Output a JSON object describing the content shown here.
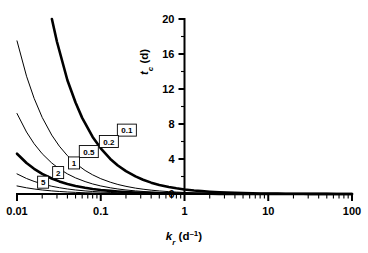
{
  "chart_data": {
    "type": "line",
    "title": "",
    "xlabel": "k_r (d^-1)",
    "ylabel": "t_c (d)",
    "xscale": "log",
    "yscale": "linear",
    "xlim": [
      0.01,
      100
    ],
    "ylim": [
      0,
      20
    ],
    "xtick_labels": [
      "0.01",
      "0.1",
      "1",
      "10",
      "100"
    ],
    "xtick_values": [
      0.01,
      0.1,
      1,
      10,
      100
    ],
    "ytick_labels": [
      "0",
      "4",
      "8",
      "12",
      "16",
      "20"
    ],
    "ytick_values": [
      0,
      4,
      8,
      12,
      16,
      20
    ],
    "yminor_values": [
      2,
      6,
      10,
      14,
      18
    ],
    "grid": false,
    "legend": "inline-labels",
    "y_axis_position": 1.0,
    "series": [
      {
        "name": "0.1",
        "label": "0.1",
        "linewidth": "thick",
        "color": "#000000",
        "x": [
          0.0261,
          0.03,
          0.04,
          0.05,
          0.06,
          0.08,
          0.1,
          0.13,
          0.16,
          0.2,
          0.26,
          0.32,
          0.4,
          0.5,
          0.65,
          0.8,
          1.0,
          1.3,
          1.6,
          2.0,
          2.6,
          3.2,
          4.0,
          5.0,
          6.5,
          8.0,
          10.0,
          13.0,
          16.0,
          20.0,
          26.0,
          32.0,
          40.0,
          50.0,
          65.0,
          80.0,
          100.0
        ],
        "y": [
          20.0,
          17.4,
          13.0,
          10.45,
          8.7,
          6.52,
          5.22,
          4.01,
          3.26,
          2.61,
          2.01,
          1.63,
          1.3,
          1.04,
          0.8,
          0.65,
          0.52,
          0.4,
          0.33,
          0.26,
          0.2,
          0.16,
          0.13,
          0.1,
          0.08,
          0.065,
          0.052,
          0.04,
          0.033,
          0.026,
          0.02,
          0.016,
          0.013,
          0.01,
          0.008,
          0.0065,
          0.0052
        ]
      },
      {
        "name": "0.2",
        "label": "0.2",
        "linewidth": "thin",
        "color": "#000000",
        "x": [
          0.01,
          0.013,
          0.016,
          0.02,
          0.026,
          0.032,
          0.04,
          0.05,
          0.065,
          0.08,
          0.1,
          0.13,
          0.16,
          0.2,
          0.26,
          0.32,
          0.4,
          0.5,
          0.65,
          0.8,
          1.0,
          1.3,
          1.6,
          2.0,
          2.6,
          3.2,
          4.0,
          5.0,
          6.5,
          8.0,
          10.0,
          13.0,
          16.0,
          20.0,
          26.0,
          32.0,
          40.0,
          50.0,
          65.0,
          80.0,
          100.0
        ],
        "y": [
          17.5,
          13.46,
          10.94,
          8.75,
          6.73,
          5.47,
          4.38,
          3.5,
          2.69,
          2.19,
          1.75,
          1.35,
          1.09,
          0.875,
          0.67,
          0.55,
          0.44,
          0.35,
          0.27,
          0.22,
          0.175,
          0.135,
          0.109,
          0.0875,
          0.067,
          0.055,
          0.044,
          0.035,
          0.027,
          0.022,
          0.0175,
          0.0135,
          0.011,
          0.0088,
          0.0067,
          0.0055,
          0.0044,
          0.0035,
          0.0027,
          0.0022,
          0.00175
        ]
      },
      {
        "name": "0.5",
        "label": "0.5",
        "linewidth": "thin",
        "color": "#000000",
        "x": [
          0.01,
          0.013,
          0.016,
          0.02,
          0.026,
          0.032,
          0.04,
          0.05,
          0.065,
          0.08,
          0.1,
          0.13,
          0.16,
          0.2,
          0.26,
          0.32,
          0.4,
          0.5,
          0.65,
          0.8,
          1.0,
          1.3,
          1.6,
          2.0,
          2.6,
          3.2,
          4.0,
          5.0,
          6.5,
          8.0,
          10.0,
          13.0,
          16.0,
          20.0,
          26.0,
          32.0,
          40.0,
          50.0,
          65.0,
          80.0,
          100.0
        ],
        "y": [
          9.2,
          7.08,
          5.75,
          4.6,
          3.54,
          2.88,
          2.3,
          1.84,
          1.42,
          1.15,
          0.92,
          0.71,
          0.575,
          0.46,
          0.354,
          0.288,
          0.23,
          0.184,
          0.142,
          0.115,
          0.092,
          0.071,
          0.0575,
          0.046,
          0.0354,
          0.0288,
          0.023,
          0.0184,
          0.0142,
          0.0115,
          0.0092,
          0.0071,
          0.00575,
          0.0046,
          0.00354,
          0.00288,
          0.0023,
          0.00184,
          0.00142,
          0.00115,
          0.00092
        ]
      },
      {
        "name": "1",
        "label": "1",
        "linewidth": "thick",
        "color": "#000000",
        "x": [
          0.01,
          0.013,
          0.016,
          0.02,
          0.026,
          0.032,
          0.04,
          0.05,
          0.065,
          0.08,
          0.1,
          0.13,
          0.16,
          0.2,
          0.26,
          0.32,
          0.4,
          0.5,
          0.65,
          0.8,
          1.0,
          1.3,
          1.6,
          2.0,
          2.6,
          3.2,
          4.0,
          5.0,
          6.5,
          8.0,
          10.0,
          13.0,
          16.0,
          20.0,
          26.0,
          32.0,
          40.0,
          50.0,
          65.0,
          80.0,
          100.0
        ],
        "y": [
          4.6,
          3.54,
          2.88,
          2.3,
          1.77,
          1.44,
          1.15,
          0.92,
          0.71,
          0.575,
          0.46,
          0.354,
          0.288,
          0.23,
          0.177,
          0.144,
          0.115,
          0.092,
          0.071,
          0.0575,
          0.046,
          0.0354,
          0.0288,
          0.023,
          0.0177,
          0.0144,
          0.0115,
          0.0092,
          0.0071,
          0.00575,
          0.0046,
          0.00354,
          0.00288,
          0.0023,
          0.00177,
          0.00144,
          0.00115,
          0.00092,
          0.00071,
          0.000575,
          0.00046
        ]
      },
      {
        "name": "2",
        "label": "2",
        "linewidth": "thin",
        "color": "#000000",
        "x": [
          0.01,
          0.013,
          0.016,
          0.02,
          0.026,
          0.032,
          0.04,
          0.05,
          0.065,
          0.08,
          0.1,
          0.13,
          0.16,
          0.2,
          0.26,
          0.32,
          0.4,
          0.5,
          0.65,
          0.8,
          1.0,
          1.3,
          1.6,
          2.0,
          2.6,
          3.2,
          4.0,
          5.0,
          6.5,
          8.0,
          10.0,
          13.0,
          16.0,
          20.0,
          26.0,
          32.0,
          40.0,
          50.0,
          65.0,
          80.0,
          100.0
        ],
        "y": [
          2.3,
          1.77,
          1.44,
          1.15,
          0.885,
          0.72,
          0.575,
          0.46,
          0.354,
          0.288,
          0.23,
          0.177,
          0.144,
          0.115,
          0.0885,
          0.072,
          0.0575,
          0.046,
          0.0354,
          0.0288,
          0.023,
          0.0177,
          0.0144,
          0.0115,
          0.00885,
          0.0072,
          0.00575,
          0.0046,
          0.00354,
          0.00288,
          0.0023,
          0.00177,
          0.00144,
          0.00115,
          0.000885,
          0.00072,
          0.000575,
          0.00046,
          0.000354,
          0.000288,
          0.00023
        ]
      },
      {
        "name": "5",
        "label": "5",
        "linewidth": "thin",
        "color": "#000000",
        "x": [
          0.01,
          0.013,
          0.016,
          0.02,
          0.026,
          0.032,
          0.04,
          0.05,
          0.065,
          0.08,
          0.1,
          0.13,
          0.16,
          0.2,
          0.26,
          0.32,
          0.4,
          0.5,
          0.65,
          0.8,
          1.0,
          1.3,
          1.6,
          2.0,
          2.6,
          3.2,
          4.0,
          5.0,
          6.5,
          8.0,
          10.0,
          13.0,
          16.0,
          20.0,
          26.0,
          32.0,
          40.0,
          50.0,
          65.0,
          80.0,
          100.0
        ],
        "y": [
          0.92,
          0.708,
          0.575,
          0.46,
          0.354,
          0.288,
          0.23,
          0.184,
          0.142,
          0.115,
          0.092,
          0.0708,
          0.0575,
          0.046,
          0.0354,
          0.0288,
          0.023,
          0.0184,
          0.0142,
          0.0115,
          0.0092,
          0.00708,
          0.00575,
          0.0046,
          0.00354,
          0.00288,
          0.0023,
          0.00184,
          0.00142,
          0.00115,
          0.00092,
          0.000708,
          0.000575,
          0.00046,
          0.000354,
          0.000288,
          0.00023,
          0.000184,
          0.000142,
          0.000115,
          9.2e-05
        ]
      }
    ],
    "curve_label_positions": [
      {
        "label": "0.1",
        "x": 0.205,
        "y": 7.3
      },
      {
        "label": "0.2",
        "x": 0.125,
        "y": 6.0
      },
      {
        "label": "0.5",
        "x": 0.072,
        "y": 4.85
      },
      {
        "label": "1",
        "x": 0.048,
        "y": 3.55
      },
      {
        "label": "2",
        "x": 0.031,
        "y": 2.45
      },
      {
        "label": "5",
        "x": 0.0205,
        "y": 1.35
      }
    ]
  },
  "axes": {
    "x_title_main": "k",
    "x_title_sub": "r",
    "x_title_unit_open": " (d",
    "x_title_unit_sup": "–1",
    "x_title_unit_close": ")",
    "y_title_main": "t",
    "y_title_sub": "c",
    "y_title_unit": " (d)"
  }
}
